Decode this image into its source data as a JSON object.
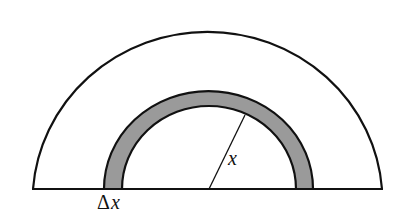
{
  "diagram": {
    "type": "annulus-cross-section",
    "labels": {
      "radius": "x",
      "thickness_delta": "Δ",
      "thickness_var": "x"
    },
    "colors": {
      "stroke": "#111111",
      "band_fill": "#9a9a9a",
      "background": "#ffffff"
    }
  }
}
